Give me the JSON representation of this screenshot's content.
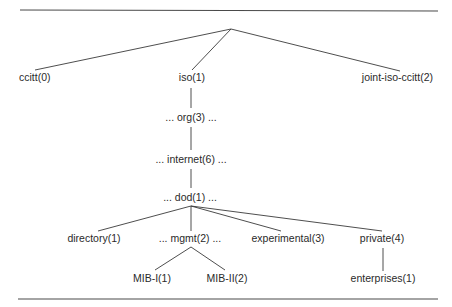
{
  "diagram": {
    "type": "tree",
    "title": "",
    "nodes": {
      "ccitt": "ccitt(0)",
      "iso": "iso(1)",
      "joint": "joint-iso-ccitt(2)",
      "org": "... org(3) ...",
      "internet": "... internet(6) ...",
      "dod": "... dod(1) ...",
      "directory": "directory(1)",
      "mgmt": "... mgmt(2) ...",
      "experimental": "experimental(3)",
      "private": "private(4)",
      "mib1": "MIB-I(1)",
      "mib2": "MIB-II(2)",
      "enterprises": "enterprises(1)"
    },
    "edges": [
      [
        "root",
        "ccitt"
      ],
      [
        "root",
        "iso"
      ],
      [
        "root",
        "joint"
      ],
      [
        "iso",
        "org"
      ],
      [
        "org",
        "internet"
      ],
      [
        "internet",
        "dod"
      ],
      [
        "dod",
        "directory"
      ],
      [
        "dod",
        "mgmt"
      ],
      [
        "dod",
        "experimental"
      ],
      [
        "dod",
        "private"
      ],
      [
        "mgmt",
        "mib1"
      ],
      [
        "mgmt",
        "mib2"
      ],
      [
        "private",
        "enterprises"
      ]
    ]
  }
}
